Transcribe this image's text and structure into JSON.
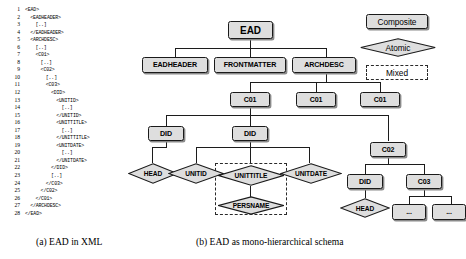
{
  "figure": {
    "caption_a": "(a) EAD in XML",
    "caption_b": "(b) EAD as mono-hierarchical schema"
  },
  "xml_listing": {
    "title": "EAD in XML",
    "lines": [
      {
        "n": "1",
        "indent": 0,
        "text": "<EAD>"
      },
      {
        "n": "2",
        "indent": 1,
        "text": "<EADHEADER>"
      },
      {
        "n": "3",
        "indent": 2,
        "text": "[..]"
      },
      {
        "n": "4",
        "indent": 1,
        "text": "</EADHEADER>"
      },
      {
        "n": "5",
        "indent": 1,
        "text": "<ARCHDESC>"
      },
      {
        "n": "6",
        "indent": 2,
        "text": "[..]"
      },
      {
        "n": "7",
        "indent": 2,
        "text": "<C01>"
      },
      {
        "n": "8",
        "indent": 3,
        "text": "[..]"
      },
      {
        "n": "9",
        "indent": 3,
        "text": "<C02>"
      },
      {
        "n": "10",
        "indent": 4,
        "text": "[..]"
      },
      {
        "n": "11",
        "indent": 4,
        "text": "<C03>"
      },
      {
        "n": "12",
        "indent": 5,
        "text": "<DID>"
      },
      {
        "n": "13",
        "indent": 6,
        "text": "<UNITID>"
      },
      {
        "n": "14",
        "indent": 7,
        "text": "[..]"
      },
      {
        "n": "15",
        "indent": 6,
        "text": "</UNITID>"
      },
      {
        "n": "16",
        "indent": 6,
        "text": "<UNITTITLE>"
      },
      {
        "n": "17",
        "indent": 7,
        "text": "[..]"
      },
      {
        "n": "18",
        "indent": 6,
        "text": "</UNITTITLE>"
      },
      {
        "n": "19",
        "indent": 6,
        "text": "<UNITDATE>"
      },
      {
        "n": "20",
        "indent": 7,
        "text": "[..]"
      },
      {
        "n": "21",
        "indent": 6,
        "text": "</UNITDATE>"
      },
      {
        "n": "22",
        "indent": 5,
        "text": "</DID>"
      },
      {
        "n": "23",
        "indent": 5,
        "text": "[..]"
      },
      {
        "n": "24",
        "indent": 4,
        "text": "</C03>"
      },
      {
        "n": "25",
        "indent": 3,
        "text": "</C02>"
      },
      {
        "n": "26",
        "indent": 2,
        "text": "</C01>"
      },
      {
        "n": "27",
        "indent": 1,
        "text": "</ARCHDESC>"
      },
      {
        "n": "28",
        "indent": 0,
        "text": "</EAD>"
      }
    ]
  },
  "legend": {
    "composite": "Composite",
    "atomic": "Atomic",
    "mixed": "Mixed"
  },
  "schema": {
    "nodes": {
      "ead": "EAD",
      "eadheader": "EADHEADER",
      "frontmatter": "FRONTMATTER",
      "archdesc": "ARCHDESC",
      "c01_a": "C01",
      "c01_b": "C01",
      "c01_c": "C01",
      "did_left": "DID",
      "did_mid": "DID",
      "c02": "C02",
      "head_left": "HEAD",
      "unitid": "UNITID",
      "unittitle": "UNITTITLE",
      "unitdate": "UNITDATE",
      "persname": "PERSNAME",
      "did_right": "DID",
      "c03": "C03",
      "head_right": "HEAD",
      "ellipsis_a": "...",
      "ellipsis_b": "..."
    }
  },
  "colors": {
    "node_fill": "#dedede",
    "node_stroke": "#1a1a1a",
    "shadow": "#8a8a8a",
    "line": "#1c1c1c",
    "background": "#ffffff"
  }
}
